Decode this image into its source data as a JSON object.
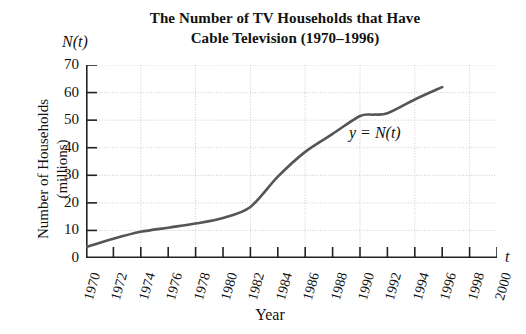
{
  "chart_data": {
    "type": "line",
    "title": "The Number of TV Households that Have Cable Television (1970–1996)",
    "title_lines": [
      "The Number of TV Households that Have",
      "Cable Television (1970–1996)"
    ],
    "xlabel": "Year",
    "ylabel": "Number of Households (millions)",
    "ylabel_lines": [
      "Number of Households",
      "(millions)"
    ],
    "x_axis_variable": "t",
    "y_axis_variable": "N(t)",
    "curve_label": "y = N(t)",
    "xlim": [
      1970,
      2000
    ],
    "ylim": [
      0,
      70
    ],
    "xticks": [
      1970,
      1972,
      1974,
      1976,
      1978,
      1980,
      1982,
      1984,
      1986,
      1988,
      1990,
      1992,
      1994,
      1996,
      1998,
      2000
    ],
    "xtick_labels": [
      "1970",
      "1972",
      "1974",
      "1976",
      "1978",
      "1980",
      "1982",
      "1984",
      "1986",
      "1988",
      "1990",
      "1992",
      "1994",
      "1996",
      "1998",
      "2000"
    ],
    "yticks": [
      0,
      10,
      20,
      30,
      40,
      50,
      60,
      70
    ],
    "ytick_labels": [
      "0",
      "10",
      "20",
      "30",
      "40",
      "50",
      "60",
      "70"
    ],
    "grid": true,
    "grid_x_step": 4,
    "grid_y_step": 10,
    "grid_color": "#cccccc",
    "line_color": "#555555",
    "line_width": 2.6,
    "x": [
      1970,
      1972,
      1974,
      1976,
      1978,
      1980,
      1982,
      1984,
      1986,
      1988,
      1990,
      1991,
      1992,
      1994,
      1996
    ],
    "values": [
      4,
      7,
      9.5,
      11,
      12.5,
      14.5,
      18.5,
      29.5,
      38.5,
      45,
      51.5,
      52,
      52.5,
      57.5,
      62
    ],
    "series": [
      {
        "name": "y = N(t)",
        "values": [
          4,
          7,
          9.5,
          11,
          12.5,
          14.5,
          18.5,
          29.5,
          38.5,
          45,
          51.5,
          52,
          52.5,
          57.5,
          62
        ]
      }
    ]
  }
}
